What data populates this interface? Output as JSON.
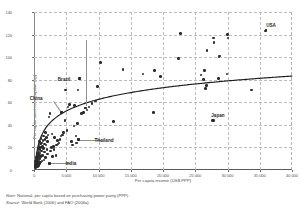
{
  "chart_data": {
    "type": "scatter",
    "title": "",
    "xlabel": "Per capita income (US$ PPP)",
    "ylabel": "Per capita meat consumption (kg)",
    "xlim": [
      0,
      40000
    ],
    "ylim": [
      0,
      140
    ],
    "xticks": [
      "0",
      "5 000",
      "10 000",
      "15 000",
      "20 000",
      "25 000",
      "30 000",
      "35 000",
      "40 000"
    ],
    "xtick_values": [
      0,
      5000,
      10000,
      15000,
      20000,
      25000,
      30000,
      35000,
      40000
    ],
    "yticks": [
      "0",
      "20",
      "40",
      "60",
      "80",
      "100",
      "120",
      "140"
    ],
    "ytick_values": [
      0,
      20,
      40,
      60,
      80,
      100,
      120,
      140
    ],
    "grid": true,
    "legend": "none",
    "trendline": {
      "present": true,
      "shape": "logarithmic",
      "description": "Fitted logarithmic curve rising steeply to ~60 kg by 10 000 US$ then flattening to ~90 kg at 40 000 US$"
    },
    "annotations": [
      {
        "label": "USA",
        "x": 36000,
        "y": 124,
        "marker_x": 36000,
        "marker_y": 124
      },
      {
        "label": "Japan",
        "x": 27800,
        "y": 44,
        "marker_x": 27800,
        "marker_y": 44
      },
      {
        "label": "Russian Federation",
        "x": 8000,
        "y": 115,
        "marker_x": 8000,
        "marker_y": 55
      },
      {
        "label": "Brazil",
        "x": 7100,
        "y": 81,
        "marker_x": 7100,
        "marker_y": 81
      },
      {
        "label": "China",
        "x": 4300,
        "y": 51,
        "marker_x": 4300,
        "marker_y": 51
      },
      {
        "label": "Thailand",
        "x": 6900,
        "y": 27,
        "marker_x": 6900,
        "marker_y": 27
      },
      {
        "label": "India",
        "x": 2400,
        "y": 6,
        "marker_x": 2400,
        "marker_y": 6
      }
    ],
    "points": [
      [
        36000,
        124
      ],
      [
        35900,
        123
      ],
      [
        33700,
        71
      ],
      [
        30100,
        117
      ],
      [
        30000,
        120
      ],
      [
        29900,
        85
      ],
      [
        28800,
        101
      ],
      [
        28700,
        100
      ],
      [
        28600,
        81
      ],
      [
        27900,
        113
      ],
      [
        27800,
        117
      ],
      [
        27700,
        44
      ],
      [
        26800,
        106
      ],
      [
        26700,
        75
      ],
      [
        26600,
        72
      ],
      [
        26400,
        88
      ],
      [
        26300,
        80
      ],
      [
        25900,
        84
      ],
      [
        22700,
        121
      ],
      [
        22400,
        99
      ],
      [
        19600,
        83
      ],
      [
        18700,
        88
      ],
      [
        18500,
        51
      ],
      [
        16900,
        85
      ],
      [
        13800,
        89
      ],
      [
        12300,
        43
      ],
      [
        10300,
        95
      ],
      [
        9800,
        74
      ],
      [
        9500,
        61
      ],
      [
        9000,
        59
      ],
      [
        8500,
        56
      ],
      [
        8200,
        53
      ],
      [
        8000,
        55
      ],
      [
        7700,
        51
      ],
      [
        7400,
        50
      ],
      [
        7100,
        81
      ],
      [
        6900,
        27
      ],
      [
        6800,
        71
      ],
      [
        6700,
        41
      ],
      [
        6600,
        24
      ],
      [
        6500,
        30
      ],
      [
        6300,
        57
      ],
      [
        6200,
        39
      ],
      [
        6000,
        22
      ],
      [
        5800,
        25
      ],
      [
        5500,
        58
      ],
      [
        5300,
        56
      ],
      [
        5100,
        35
      ],
      [
        4900,
        71
      ],
      [
        4800,
        44
      ],
      [
        4600,
        33
      ],
      [
        4400,
        31
      ],
      [
        4300,
        51
      ],
      [
        4200,
        30
      ],
      [
        4000,
        27
      ],
      [
        3900,
        24
      ],
      [
        3700,
        23
      ],
      [
        3600,
        26
      ],
      [
        3500,
        22
      ],
      [
        3400,
        13
      ],
      [
        3200,
        29
      ],
      [
        3100,
        18
      ],
      [
        3000,
        21
      ],
      [
        2900,
        12
      ],
      [
        2800,
        32
      ],
      [
        2700,
        20
      ],
      [
        2600,
        17
      ],
      [
        2500,
        50
      ],
      [
        2400,
        6
      ],
      [
        2300,
        47
      ],
      [
        2200,
        31
      ],
      [
        2100,
        14
      ],
      [
        2050,
        25
      ],
      [
        2000,
        18
      ],
      [
        1900,
        29
      ],
      [
        1850,
        22
      ],
      [
        1800,
        11
      ],
      [
        1750,
        33
      ],
      [
        1700,
        27
      ],
      [
        1650,
        16
      ],
      [
        1600,
        23
      ],
      [
        1550,
        9
      ],
      [
        1500,
        30
      ],
      [
        1450,
        19
      ],
      [
        1400,
        26
      ],
      [
        1350,
        13
      ],
      [
        1300,
        21
      ],
      [
        1250,
        8
      ],
      [
        1200,
        24
      ],
      [
        1150,
        17
      ],
      [
        1100,
        28
      ],
      [
        1080,
        12
      ],
      [
        1050,
        20
      ],
      [
        1000,
        7
      ],
      [
        980,
        23
      ],
      [
        950,
        15
      ],
      [
        920,
        10
      ],
      [
        900,
        18
      ],
      [
        880,
        25
      ],
      [
        850,
        6
      ],
      [
        820,
        13
      ],
      [
        800,
        21
      ],
      [
        780,
        9
      ],
      [
        760,
        16
      ],
      [
        740,
        4
      ],
      [
        720,
        12
      ],
      [
        700,
        19
      ],
      [
        680,
        7
      ],
      [
        660,
        14
      ],
      [
        640,
        10
      ],
      [
        620,
        5
      ],
      [
        600,
        17
      ],
      [
        580,
        8
      ],
      [
        560,
        11
      ],
      [
        540,
        3
      ],
      [
        520,
        15
      ],
      [
        500,
        6
      ],
      [
        480,
        9
      ],
      [
        460,
        13
      ],
      [
        440,
        4
      ],
      [
        420,
        7
      ],
      [
        400,
        10
      ],
      [
        380,
        5
      ],
      [
        360,
        8
      ],
      [
        340,
        3
      ],
      [
        320,
        6
      ],
      [
        300,
        11
      ],
      [
        280,
        4
      ],
      [
        260,
        7
      ],
      [
        240,
        2
      ],
      [
        220,
        5
      ],
      [
        200,
        8
      ],
      [
        180,
        3
      ]
    ]
  },
  "footnote": {
    "note_prefix": "Note:",
    "note_text": " National, per capita based on purchasing power parity (PPP).",
    "source_prefix": "Source:",
    "source_text": " World Bank (2006) and FAO (2006a)."
  }
}
